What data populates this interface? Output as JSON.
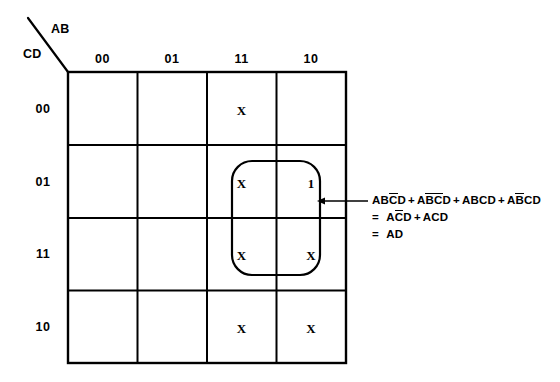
{
  "diagram": {
    "type": "karnaugh-map",
    "axes": {
      "column_variable_label": "AB",
      "row_variable_label": "CD",
      "column_headers": [
        "00",
        "01",
        "11",
        "10"
      ],
      "row_headers": [
        "00",
        "01",
        "11",
        "10"
      ]
    },
    "grid": {
      "rows": [
        {
          "row_label": "00",
          "cells": [
            "",
            "",
            "X",
            ""
          ]
        },
        {
          "row_label": "01",
          "cells": [
            "",
            "",
            "X",
            "1"
          ]
        },
        {
          "row_label": "11",
          "cells": [
            "",
            "",
            "X",
            "X"
          ]
        },
        {
          "row_label": "10",
          "cells": [
            "",
            "",
            "X",
            "X"
          ]
        }
      ]
    },
    "grouping": {
      "name": "AD group",
      "covered_cells": [
        "row 01 / col 11",
        "row 01 / col 10",
        "row 11 / col 11",
        "row 11 / col 10"
      ]
    },
    "expressions": {
      "line1": {
        "terms": [
          {
            "prefix": "AB",
            "bar": "C",
            "suffix": "D"
          },
          {
            "prefix": "A",
            "bar": "B",
            "bar2": "C",
            "suffix": "D"
          },
          {
            "prefix": "ABCD",
            "bar": "",
            "suffix": ""
          },
          {
            "prefix": "A",
            "bar": "B",
            "suffix": "CD"
          }
        ],
        "plain": "ABC̄D + AB̄C̄D + ABCD + AB̄CD"
      },
      "line2": {
        "equals": "=",
        "plain": "AC̄D + ACD"
      },
      "line3": {
        "equals": "=",
        "result": "AD",
        "plain": "= AD"
      }
    },
    "symbols": {
      "plus": "+",
      "equals": "=",
      "mark_x": "X",
      "mark_one": "1"
    },
    "colors": {
      "ink": "#000000",
      "background": "#ffffff"
    }
  }
}
